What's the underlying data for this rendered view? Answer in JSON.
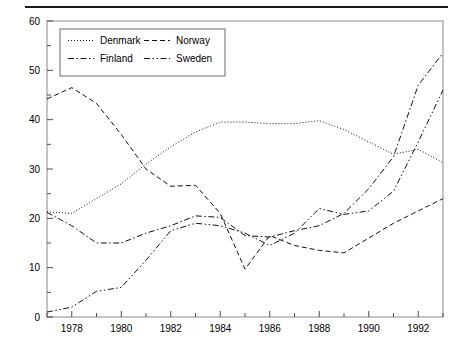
{
  "figure": {
    "rule_above": true,
    "background_color": "#ffffff",
    "line_color": "#1a1a1a"
  },
  "chart_data": {
    "type": "line",
    "title": "",
    "xlabel": "",
    "ylabel": "",
    "xlim": [
      1977,
      1993
    ],
    "ylim": [
      0,
      60
    ],
    "grid": false,
    "y_ticks": [
      0,
      10,
      20,
      30,
      40,
      50,
      60
    ],
    "y_minor_ticks": [
      5,
      15,
      25,
      35,
      45,
      55
    ],
    "x_ticks": [
      1977,
      1978,
      1979,
      1980,
      1981,
      1982,
      1983,
      1984,
      1985,
      1986,
      1987,
      1988,
      1989,
      1990,
      1991,
      1992,
      1993
    ],
    "x_tick_labels": [
      "",
      "1978",
      "",
      "1980",
      "",
      "1982",
      "",
      "1984",
      "",
      "1986",
      "",
      "1988",
      "",
      "1990",
      "",
      "1992",
      ""
    ],
    "x": [
      1977,
      1978,
      1979,
      1980,
      1981,
      1982,
      1983,
      1984,
      1985,
      1986,
      1987,
      1988,
      1989,
      1990,
      1991,
      1992,
      1993
    ],
    "legend_position": "upper-left-inside",
    "series": [
      {
        "name": "Denmark",
        "linestyle": "dotted",
        "values": [
          21.3,
          21.0,
          24.0,
          27.0,
          31.0,
          34.5,
          37.5,
          39.5,
          39.5,
          39.2,
          39.2,
          39.8,
          38.0,
          35.5,
          33.0,
          34.0,
          31.3
        ]
      },
      {
        "name": "Norway",
        "linestyle": "dashed",
        "values": [
          44.2,
          46.5,
          43.3,
          37.0,
          30.0,
          26.5,
          26.7,
          21.0,
          9.7,
          16.5,
          14.5,
          13.5,
          13.0,
          16.0,
          19.0,
          21.5,
          24.0
        ]
      },
      {
        "name": "Finland",
        "linestyle": "dash-dot",
        "values": [
          21.2,
          18.5,
          15.0,
          15.0,
          17.0,
          18.5,
          20.5,
          20.2,
          16.5,
          16.2,
          17.5,
          18.5,
          21.0,
          26.0,
          32.5,
          47.0,
          53.5
        ]
      },
      {
        "name": "Sweden",
        "linestyle": "dash-dot-dot",
        "values": [
          1.0,
          2.0,
          5.2,
          6.0,
          11.5,
          17.5,
          19.0,
          18.5,
          17.0,
          14.5,
          17.0,
          22.0,
          20.8,
          21.5,
          25.5,
          35.5,
          46.0
        ]
      }
    ]
  },
  "legend": {
    "entries": [
      {
        "label": "Denmark",
        "style": "dotted"
      },
      {
        "label": "Norway",
        "style": "dashed"
      },
      {
        "label": "Finland",
        "style": "dash-dot"
      },
      {
        "label": "Sweden",
        "style": "dash-dot-dot"
      }
    ]
  }
}
